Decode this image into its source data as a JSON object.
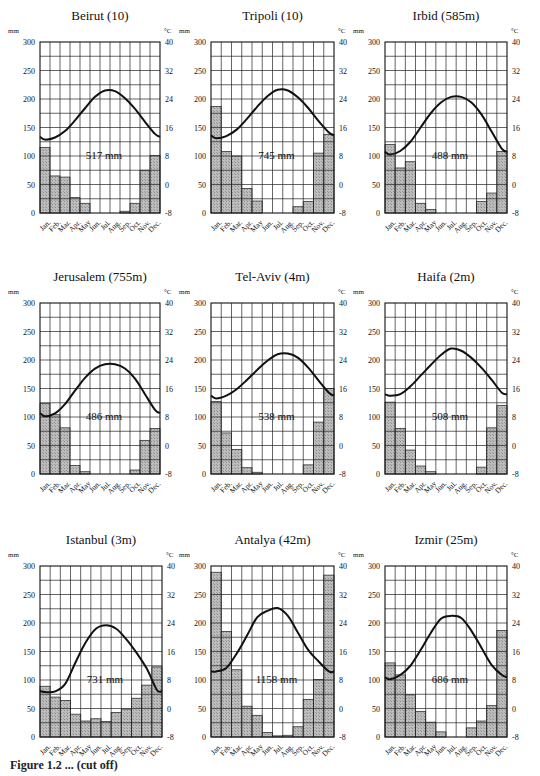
{
  "figure": {
    "caption": "Figure 1.2 ... (cut off)",
    "units_left": "mm",
    "units_right": "°C",
    "months": [
      "Jan.",
      "Feb.",
      "Mar.",
      "Apr.",
      "May",
      "Jun.",
      "Jul.",
      "Aug.",
      "Sep.",
      "Oct.",
      "Nov.",
      "Dec."
    ],
    "left_ticks": [
      "0",
      "50",
      "100",
      "150",
      "200",
      "250",
      "300"
    ],
    "right_ticks": [
      "-8",
      "0",
      "8",
      "16",
      "24",
      "32",
      "40"
    ]
  },
  "chart_data": [
    {
      "type": "bar+line",
      "title": "Beirut (10)",
      "total_label": "517 mm",
      "xlabel": "",
      "ylabel": "mm",
      "y2label": "°C",
      "ylim": [
        0,
        300
      ],
      "y2lim": [
        -8,
        40
      ],
      "categories": [
        "Jan.",
        "Feb.",
        "Mar.",
        "Apr.",
        "May",
        "Jun.",
        "Jul.",
        "Aug.",
        "Sep.",
        "Oct.",
        "Nov.",
        "Dec."
      ],
      "series": [
        {
          "name": "precipitation_mm",
          "type": "bar",
          "values": [
            115,
            65,
            63,
            27,
            17,
            0,
            0,
            0,
            3,
            17,
            75,
            101
          ]
        },
        {
          "name": "temperature_c",
          "type": "line",
          "values": [
            12.6,
            13.2,
            15.0,
            18.0,
            21.4,
            24.6,
            26.4,
            26.2,
            24.2,
            21.2,
            17.6,
            14.2
          ]
        }
      ],
      "grid": true
    },
    {
      "type": "bar+line",
      "title": "Tripoli (10)",
      "total_label": "745 mm",
      "xlabel": "",
      "ylabel": "mm",
      "y2label": "°C",
      "ylim": [
        0,
        300
      ],
      "y2lim": [
        -8,
        40
      ],
      "categories": [
        "Jan.",
        "Feb.",
        "Mar.",
        "Apr.",
        "May",
        "Jun.",
        "Jul.",
        "Aug.",
        "Sep.",
        "Oct.",
        "Nov.",
        "Dec."
      ],
      "series": [
        {
          "name": "precipitation_mm",
          "type": "bar",
          "values": [
            187,
            108,
            100,
            43,
            21,
            0,
            0,
            0,
            11,
            20,
            105,
            138
          ]
        },
        {
          "name": "temperature_c",
          "type": "line",
          "values": [
            13.0,
            13.6,
            15.4,
            18.4,
            21.8,
            24.8,
            26.6,
            26.4,
            24.4,
            21.4,
            17.8,
            14.6
          ]
        }
      ],
      "grid": true
    },
    {
      "type": "bar+line",
      "title": "Irbid (585m)",
      "total_label": "488 mm",
      "xlabel": "",
      "ylabel": "mm",
      "y2label": "°C",
      "ylim": [
        0,
        300
      ],
      "y2lim": [
        -8,
        40
      ],
      "categories": [
        "Jan.",
        "Feb.",
        "Mar.",
        "Apr.",
        "May",
        "Jun.",
        "Jul.",
        "Aug.",
        "Sep.",
        "Oct.",
        "Nov.",
        "Dec."
      ],
      "series": [
        {
          "name": "precipitation_mm",
          "type": "bar",
          "values": [
            120,
            79,
            90,
            17,
            6,
            0,
            0,
            0,
            0,
            20,
            35,
            108
          ]
        },
        {
          "name": "temperature_c",
          "type": "line",
          "values": [
            8.4,
            9.4,
            12.0,
            16.0,
            20.0,
            23.0,
            24.6,
            24.6,
            23.0,
            19.6,
            14.8,
            10.0
          ]
        }
      ],
      "grid": true
    },
    {
      "type": "bar+line",
      "title": "Jerusalem (755m)",
      "total_label": "486 mm",
      "xlabel": "",
      "ylabel": "mm",
      "y2label": "°C",
      "ylim": [
        0,
        300
      ],
      "y2lim": [
        -8,
        40
      ],
      "categories": [
        "Jan.",
        "Feb.",
        "Mar.",
        "Apr.",
        "May",
        "Jun.",
        "Jul.",
        "Aug.",
        "Sep.",
        "Oct.",
        "Nov.",
        "Dec."
      ],
      "series": [
        {
          "name": "precipitation_mm",
          "type": "bar",
          "values": [
            124,
            104,
            81,
            15,
            4,
            0,
            0,
            0,
            0,
            7,
            59,
            80
          ]
        },
        {
          "name": "temperature_c",
          "type": "line",
          "values": [
            8.2,
            9.0,
            11.6,
            15.4,
            19.0,
            21.6,
            22.8,
            22.8,
            21.6,
            18.8,
            14.4,
            10.0
          ]
        }
      ],
      "grid": true
    },
    {
      "type": "bar+line",
      "title": "Tel-Aviv (4m)",
      "total_label": "538 mm",
      "xlabel": "",
      "ylabel": "mm",
      "y2label": "°C",
      "ylim": [
        0,
        300
      ],
      "y2lim": [
        -8,
        40
      ],
      "categories": [
        "Jan.",
        "Feb.",
        "Mar.",
        "Apr.",
        "May",
        "Jun.",
        "Jul.",
        "Aug.",
        "Sep.",
        "Oct.",
        "Nov.",
        "Dec."
      ],
      "series": [
        {
          "name": "precipitation_mm",
          "type": "bar",
          "values": [
            127,
            72,
            43,
            11,
            3,
            0,
            0,
            0,
            0,
            16,
            91,
            150
          ]
        },
        {
          "name": "temperature_c",
          "type": "line",
          "values": [
            13.2,
            14.0,
            15.8,
            18.4,
            21.2,
            23.8,
            25.6,
            25.8,
            24.6,
            21.8,
            18.2,
            14.8
          ]
        }
      ],
      "grid": true
    },
    {
      "type": "bar+line",
      "title": "Haifa (2m)",
      "total_label": "508 mm",
      "xlabel": "",
      "ylabel": "mm",
      "y2label": "°C",
      "ylim": [
        0,
        300
      ],
      "y2lim": [
        -8,
        40
      ],
      "categories": [
        "Jan.",
        "Feb.",
        "Mar.",
        "Apr.",
        "May",
        "Jun.",
        "Jul.",
        "Aug.",
        "Sep.",
        "Oct.",
        "Nov.",
        "Dec."
      ],
      "series": [
        {
          "name": "precipitation_mm",
          "type": "bar",
          "values": [
            126,
            80,
            42,
            14,
            4,
            0,
            0,
            0,
            0,
            12,
            81,
            120
          ]
        },
        {
          "name": "temperature_c",
          "type": "line",
          "values": [
            14.0,
            14.4,
            16.6,
            19.6,
            22.6,
            25.4,
            27.2,
            26.6,
            24.6,
            21.8,
            18.4,
            14.8
          ]
        }
      ],
      "grid": true
    },
    {
      "type": "bar+line",
      "title": "Istanbul (3m)",
      "total_label": "731 mm",
      "xlabel": "",
      "ylabel": "mm",
      "y2label": "°C",
      "ylim": [
        0,
        300
      ],
      "y2lim": [
        -8,
        40
      ],
      "categories": [
        "Jan.",
        "Feb.",
        "Mar.",
        "Apr.",
        "May",
        "Jun.",
        "Jul.",
        "Aug.",
        "Sep.",
        "Oct.",
        "Nov.",
        "Dec."
      ],
      "series": [
        {
          "name": "precipitation_mm",
          "type": "bar",
          "values": [
            89,
            70,
            64,
            40,
            28,
            32,
            27,
            43,
            49,
            68,
            91,
            123
          ]
        },
        {
          "name": "temperature_c",
          "type": "line",
          "values": [
            4.6,
            4.8,
            7.0,
            13.0,
            18.6,
            22.4,
            23.4,
            22.4,
            19.4,
            15.6,
            11.2,
            5.2
          ]
        }
      ],
      "grid": true
    },
    {
      "type": "bar+line",
      "title": "Antalya (42m)",
      "total_label": "1158 mm",
      "xlabel": "",
      "ylabel": "mm",
      "y2label": "°C",
      "ylim": [
        0,
        300
      ],
      "y2lim": [
        -8,
        40
      ],
      "categories": [
        "Jan.",
        "Feb.",
        "Mar.",
        "Apr.",
        "May",
        "Jun.",
        "Jul.",
        "Aug.",
        "Sep.",
        "Oct.",
        "Nov.",
        "Dec."
      ],
      "series": [
        {
          "name": "precipitation_mm",
          "type": "bar",
          "values": [
            289,
            185,
            118,
            54,
            38,
            8,
            2,
            3,
            18,
            66,
            101,
            284
          ]
        },
        {
          "name": "temperature_c",
          "type": "line",
          "values": [
            10.4,
            11.4,
            15.4,
            20.4,
            25.6,
            27.4,
            28.2,
            26.0,
            21.2,
            16.4,
            13.2,
            10.4
          ]
        }
      ],
      "grid": true
    },
    {
      "type": "bar+line",
      "title": "Izmir (25m)",
      "total_label": "686 mm",
      "xlabel": "",
      "ylabel": "mm",
      "y2label": "°C",
      "ylim": [
        0,
        300
      ],
      "y2lim": [
        -8,
        40
      ],
      "categories": [
        "Jan.",
        "Feb.",
        "Mar.",
        "Apr.",
        "May",
        "Jun.",
        "Jul.",
        "Aug.",
        "Sep.",
        "Oct.",
        "Nov.",
        "Dec."
      ],
      "series": [
        {
          "name": "precipitation_mm",
          "type": "bar",
          "values": [
            130,
            109,
            74,
            45,
            26,
            9,
            0,
            0,
            16,
            28,
            55,
            187
          ]
        },
        {
          "name": "temperature_c",
          "type": "line",
          "values": [
            8.2,
            9.4,
            12.0,
            16.4,
            21.2,
            25.2,
            26.0,
            25.4,
            21.8,
            17.0,
            12.2,
            9.4
          ]
        }
      ],
      "grid": true
    }
  ]
}
